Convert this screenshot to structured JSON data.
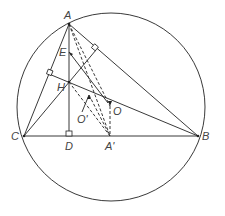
{
  "points": {
    "A": {
      "label": "A"
    },
    "B": {
      "label": "B"
    },
    "C": {
      "label": "C"
    },
    "D": {
      "label": "D"
    },
    "A1": {
      "label": "A'"
    },
    "O": {
      "label": "O"
    },
    "O1": {
      "label": "O'"
    },
    "H": {
      "label": "H"
    },
    "E": {
      "label": "E"
    }
  },
  "colors": {
    "stroke": "#222222",
    "label": "#444444",
    "background": "#ffffff"
  }
}
